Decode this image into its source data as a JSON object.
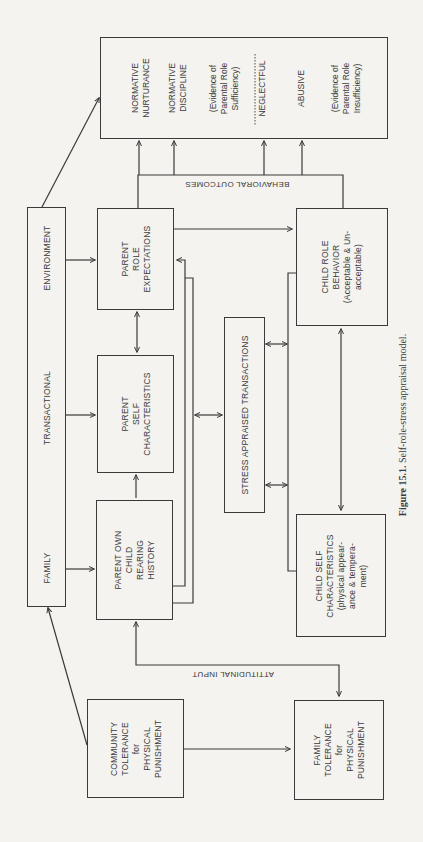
{
  "figure": {
    "caption_label": "Figure 15.1.",
    "caption_text": " Self-role-stress appraisal model."
  },
  "environment_box": {
    "family": "FAMILY",
    "transactional": "TRANSACTIONAL",
    "environment": "ENVIRONMENT"
  },
  "boxes": {
    "parent_role_expectations": [
      "PARENT",
      "ROLE",
      "EXPECTATIONS"
    ],
    "parent_self_characteristics": [
      "PARENT",
      "SELF",
      "CHARACTERISTICS"
    ],
    "parent_own_history": [
      "PARENT OWN",
      "CHILD",
      "REARING",
      "HISTORY"
    ],
    "stress_appraised": [
      "STRESS APPRAISED TRANSACTIONS"
    ],
    "child_role_behavior": [
      "CHILD ROLE",
      "BEHAVIOR",
      "(Acceptable & Un-",
      "acceptable)"
    ],
    "child_self_characteristics": [
      "CHILD SELF",
      "CHARACTERISTICS",
      "(physical appear-",
      "ance & tempera-",
      "ment)"
    ],
    "community_tolerance": [
      "COMMUNITY",
      "TOLERANCE",
      "for",
      "PHYSICAL",
      "PUNISHMENT"
    ],
    "family_tolerance": [
      "FAMILY",
      "TOLERANCE",
      "for",
      "PHYSICAL",
      "PUNISHMENT"
    ]
  },
  "outcomes": {
    "items": [
      [
        "NORMATIVE",
        "NURTURANCE"
      ],
      [
        "NORMATIVE",
        "DISCIPLINE"
      ],
      [
        "(Evidence of",
        "Parental Role",
        "Sufficiency)"
      ],
      [
        "NEGLECTFUL"
      ],
      [
        "ABUSIVE"
      ],
      [
        "(Evidence of",
        "Parental Role",
        "Insufficiency)"
      ]
    ]
  },
  "labels": {
    "behavioral_outcomes": "BEHAVIORAL OUTCOMES",
    "attitudinal_input": "ATTITUDINAL INPUT"
  }
}
